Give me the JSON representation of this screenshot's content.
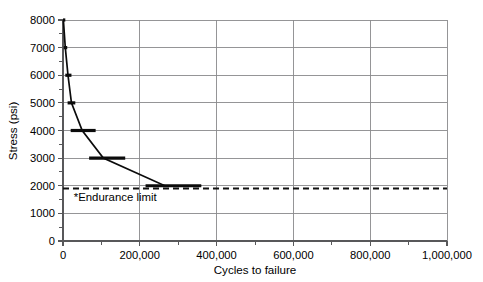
{
  "chart_data": {
    "type": "line",
    "title": "",
    "xlabel": "Cycles to failure",
    "ylabel": "Stress (psi)",
    "xlim": [
      0,
      1000000
    ],
    "ylim": [
      0,
      8000
    ],
    "grid": true,
    "legend": "none",
    "x_major_step": 200000,
    "x_minor_step": 100000,
    "y_major_step": 1000,
    "y_minor_step": 500,
    "x_tick_labels": [
      "0",
      "200,000",
      "400,000",
      "600,000",
      "800,000",
      "1,000,000"
    ],
    "x_tick_values": [
      0,
      200000,
      400000,
      600000,
      800000,
      1000000
    ],
    "y_tick_labels": [
      "0",
      "1000",
      "2000",
      "3000",
      "4000",
      "5000",
      "6000",
      "7000",
      "8000"
    ],
    "y_tick_values": [
      0,
      1000,
      2000,
      3000,
      4000,
      5000,
      6000,
      7000,
      8000
    ],
    "series": [
      {
        "name": "S-N fatigue curve",
        "x": [
          1000,
          6000,
          13000,
          22000,
          50000,
          105000,
          265000,
          360000
        ],
        "y": [
          8000,
          7000,
          6000,
          5000,
          4000,
          3000,
          2000,
          2000
        ]
      }
    ],
    "data_markers": [
      {
        "stress": 8000,
        "x_start": 0,
        "x_end": 6000
      },
      {
        "stress": 7000,
        "x_start": 2000,
        "x_end": 11000
      },
      {
        "stress": 6000,
        "x_start": 6000,
        "x_end": 22000
      },
      {
        "stress": 5000,
        "x_start": 12000,
        "x_end": 32000
      },
      {
        "stress": 4000,
        "x_start": 20000,
        "x_end": 85000
      },
      {
        "stress": 3000,
        "x_start": 68000,
        "x_end": 162000
      },
      {
        "stress": 2000,
        "x_start": 215000,
        "x_end": 360000
      }
    ],
    "annotations": [
      {
        "text": "*Endurance limit",
        "x": 28000,
        "y": 1450
      }
    ],
    "reference_lines": [
      {
        "name": "endurance-limit",
        "orientation": "horizontal",
        "value": 1900,
        "style": "dashed"
      }
    ]
  },
  "colors": {
    "background": "#ffffff",
    "grid": "#8a8a8c",
    "axis": "#58585a",
    "series": "#0b0b0b",
    "endurance": "#111111"
  }
}
